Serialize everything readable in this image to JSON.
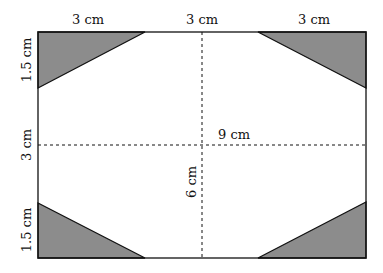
{
  "diagram": {
    "colors": {
      "shade": "#8c8c8c",
      "line": "#111111",
      "background": "#ffffff"
    },
    "labels": {
      "top_left": "3 cm",
      "top_middle": "3 cm",
      "top_right": "3 cm",
      "left_top": "1.5 cm",
      "left_middle": "3 cm",
      "left_bottom": "1.5 cm",
      "horizontal_dashed": "9 cm",
      "vertical_dashed": "6 cm"
    }
  }
}
